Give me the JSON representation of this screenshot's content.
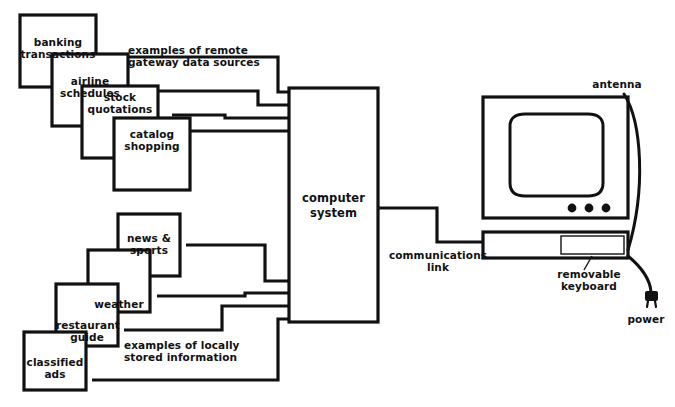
{
  "diagram": {
    "ink_color": "#111111",
    "background_color": "#ffffff"
  },
  "remote_sources": {
    "caption": "examples of remote\ngateway data sources",
    "boxes": [
      {
        "label": "banking\ntransactions"
      },
      {
        "label": "airline\nschedules"
      },
      {
        "label": "stock\nquotations"
      },
      {
        "label": "catalog\nshopping"
      }
    ]
  },
  "local_sources": {
    "caption": "examples of locally\nstored information",
    "boxes": [
      {
        "label": "news &\nsports"
      },
      {
        "label": "weather"
      },
      {
        "label": "restaurant\nguide"
      },
      {
        "label": "classified\nads"
      }
    ]
  },
  "core": {
    "computer_system_label": "computer\nsystem",
    "communications_link_label": "communications\nlink"
  },
  "terminal": {
    "antenna_label": "antenna",
    "keyboard_label": "removable\nkeyboard",
    "power_label": "power",
    "indicator_count": 3
  }
}
